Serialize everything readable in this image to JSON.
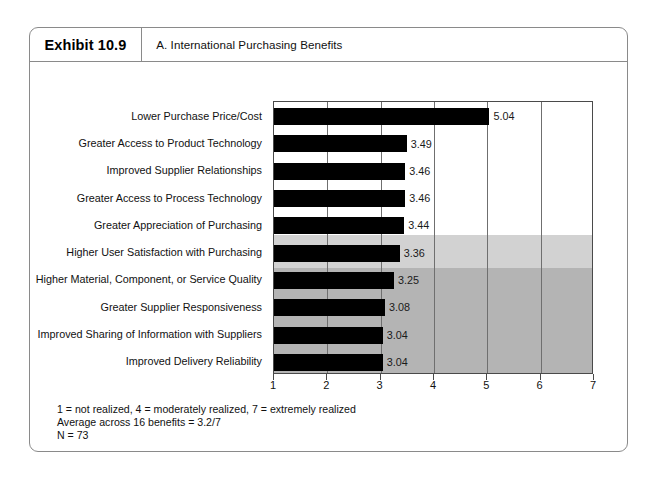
{
  "exhibit": {
    "number": "Exhibit 10.9",
    "title": "A. International Purchasing Benefits"
  },
  "footnotes": {
    "scale": "1 = not realized, 4 = moderately realized, 7 = extremely realized",
    "average": "Average across 16 benefits = 3.2/7",
    "sample": "N = 73"
  },
  "colors": {
    "bar": "#000000",
    "band_light": "#d2d2d2",
    "band_dark": "#b4b4b4",
    "frame": "#8a8a8a",
    "axis": "#4a4a4a",
    "gridline": "#6f6f6f"
  },
  "chart_data": {
    "type": "bar",
    "orientation": "horizontal",
    "title": "A. International Purchasing Benefits",
    "xlabel": "",
    "ylabel": "",
    "xlim": [
      1,
      7
    ],
    "xticks": [
      1,
      2,
      3,
      4,
      5,
      6,
      7
    ],
    "xticklabels": [
      "1",
      "2",
      "3",
      "4",
      "5",
      "6",
      "7"
    ],
    "grid": "vertical gridlines at 2,3,4,5,6",
    "legend": "none",
    "categories": [
      "Lower Purchase Price/Cost",
      "Greater Access to Product Technology",
      "Improved Supplier Relationships",
      "Greater Access to Process Technology",
      "Greater Appreciation of Purchasing",
      "Higher User Satisfaction with Purchasing",
      "Higher Material, Component, or Service Quality",
      "Greater Supplier Responsiveness",
      "Improved Sharing of Information with Suppliers",
      "Improved Delivery Reliability"
    ],
    "values": [
      5.04,
      3.49,
      3.46,
      3.46,
      3.44,
      3.36,
      3.25,
      3.08,
      3.04,
      3.04
    ],
    "value_labels": [
      "5.04",
      "3.49",
      "3.46",
      "3.46",
      "3.44",
      "3.36",
      "3.25",
      "3.08",
      "3.04",
      "3.04"
    ],
    "annotations": [
      "1 = not realized, 4 = moderately realized, 7 = extremely realized",
      "Average across 16 benefits = 3.2/7",
      "N = 73"
    ]
  }
}
